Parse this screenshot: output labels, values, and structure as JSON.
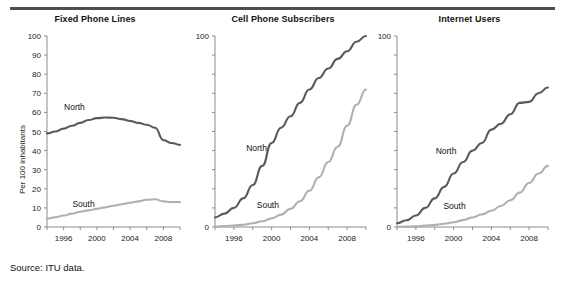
{
  "figure": {
    "source_note": "Source: ITU data.",
    "y_axis_label": "Per 100 inhabitants",
    "north_color": "#5a5a5a",
    "south_color": "#b0b0b0",
    "axis_color": "#8c8c8c",
    "rule_color": "#4d4d4d"
  },
  "chart_data": [
    {
      "type": "line",
      "title": "Fixed Phone Lines",
      "xlabel": "",
      "ylabel": "Per 100 inhabitants",
      "xlim": [
        1994,
        2010
      ],
      "ylim": [
        0,
        100
      ],
      "yticks": [
        0,
        10,
        20,
        30,
        40,
        50,
        60,
        70,
        80,
        90,
        100
      ],
      "ytick_labels": [
        "0",
        "10",
        "20",
        "30",
        "40",
        "50",
        "60",
        "70",
        "80",
        "90",
        "100"
      ],
      "xticks": [
        1994,
        1996,
        1998,
        2000,
        2002,
        2004,
        2006,
        2008,
        2010
      ],
      "xtick_labels": [
        "",
        "1996",
        "",
        "2000",
        "",
        "2004",
        "",
        "2008",
        ""
      ],
      "grid": false,
      "legend": "inline-labels",
      "x": [
        1994,
        1995,
        1996,
        1997,
        1998,
        1999,
        2000,
        2001,
        2002,
        2003,
        2004,
        2005,
        2006,
        2007,
        2008,
        2009,
        2010
      ],
      "series": [
        {
          "name": "North",
          "color": "#5a5a5a",
          "label_x": 1997.3,
          "label_y": 61,
          "values": [
            49,
            50,
            51.5,
            53,
            54.5,
            56,
            57,
            57.3,
            57.2,
            56.5,
            55.5,
            54.5,
            53.5,
            52,
            45.5,
            44,
            43
          ]
        },
        {
          "name": "South",
          "color": "#b0b0b0",
          "label_x": 1998.4,
          "label_y": 10.5,
          "values": [
            4.3,
            5.1,
            6,
            7,
            8,
            8.7,
            9.5,
            10.3,
            11.1,
            11.9,
            12.7,
            13.4,
            14.3,
            14.5,
            13.4,
            13.1,
            13
          ]
        }
      ]
    },
    {
      "type": "line",
      "title": "Cell Phone Subscribers",
      "xlabel": "",
      "ylabel": "",
      "xlim": [
        1994,
        2010
      ],
      "ylim": [
        0,
        100
      ],
      "yticks": [
        0,
        10,
        20,
        30,
        40,
        50,
        60,
        70,
        80,
        90,
        100
      ],
      "ytick_labels": [
        "0",
        "",
        "",
        "",
        "",
        "",
        "",
        "",
        "",
        "",
        "100"
      ],
      "xticks": [
        1994,
        1996,
        1998,
        2000,
        2002,
        2004,
        2006,
        2008,
        2010
      ],
      "xtick_labels": [
        "",
        "1996",
        "",
        "2000",
        "",
        "2004",
        "",
        "2008",
        ""
      ],
      "grid": false,
      "legend": "inline-labels",
      "x": [
        1994,
        1995,
        1996,
        1997,
        1998,
        1999,
        2000,
        2001,
        2002,
        2003,
        2004,
        2005,
        2006,
        2007,
        2008,
        2009,
        2010
      ],
      "series": [
        {
          "name": "North",
          "color": "#5a5a5a",
          "label_x": 1998.4,
          "label_y": 40,
          "values": [
            5,
            7,
            10,
            15,
            22,
            32,
            44,
            52,
            58,
            65,
            72,
            78,
            83,
            88,
            92,
            97,
            100
          ]
        },
        {
          "name": "South",
          "color": "#b0b0b0",
          "label_x": 1999.6,
          "label_y": 10,
          "values": [
            0.3,
            0.5,
            0.8,
            1.2,
            2,
            3,
            4.5,
            6.5,
            9.5,
            13.5,
            19,
            26,
            34,
            42,
            53,
            64,
            72
          ]
        }
      ]
    },
    {
      "type": "line",
      "title": "Internet Users",
      "xlabel": "",
      "ylabel": "",
      "xlim": [
        1994,
        2010
      ],
      "ylim": [
        0,
        100
      ],
      "yticks": [
        0,
        10,
        20,
        30,
        40,
        50,
        60,
        70,
        80,
        90,
        100
      ],
      "ytick_labels": [
        "0",
        "",
        "",
        "",
        "",
        "",
        "",
        "",
        "",
        "",
        "100"
      ],
      "xticks": [
        1994,
        1996,
        1998,
        2000,
        2002,
        2004,
        2006,
        2008,
        2010
      ],
      "xtick_labels": [
        "",
        "1996",
        "",
        "2000",
        "",
        "2004",
        "",
        "2008",
        ""
      ],
      "grid": false,
      "legend": "inline-labels",
      "x": [
        1994,
        1995,
        1996,
        1997,
        1998,
        1999,
        2000,
        2001,
        2002,
        2003,
        2004,
        2005,
        2006,
        2007,
        2008,
        2009,
        2010
      ],
      "series": [
        {
          "name": "North",
          "color": "#5a5a5a",
          "label_x": 1999.2,
          "label_y": 38,
          "values": [
            2,
            3.5,
            6,
            10,
            15,
            21,
            28,
            34,
            40,
            44,
            51,
            54,
            59,
            65,
            65.5,
            70,
            73
          ]
        },
        {
          "name": "South",
          "color": "#b0b0b0",
          "label_x": 2000.1,
          "label_y": 9.5,
          "values": [
            0.1,
            0.2,
            0.4,
            0.7,
            1.1,
            1.7,
            2.5,
            3.6,
            5,
            6.6,
            8.5,
            11,
            14,
            18,
            23,
            28,
            32
          ]
        }
      ]
    }
  ]
}
